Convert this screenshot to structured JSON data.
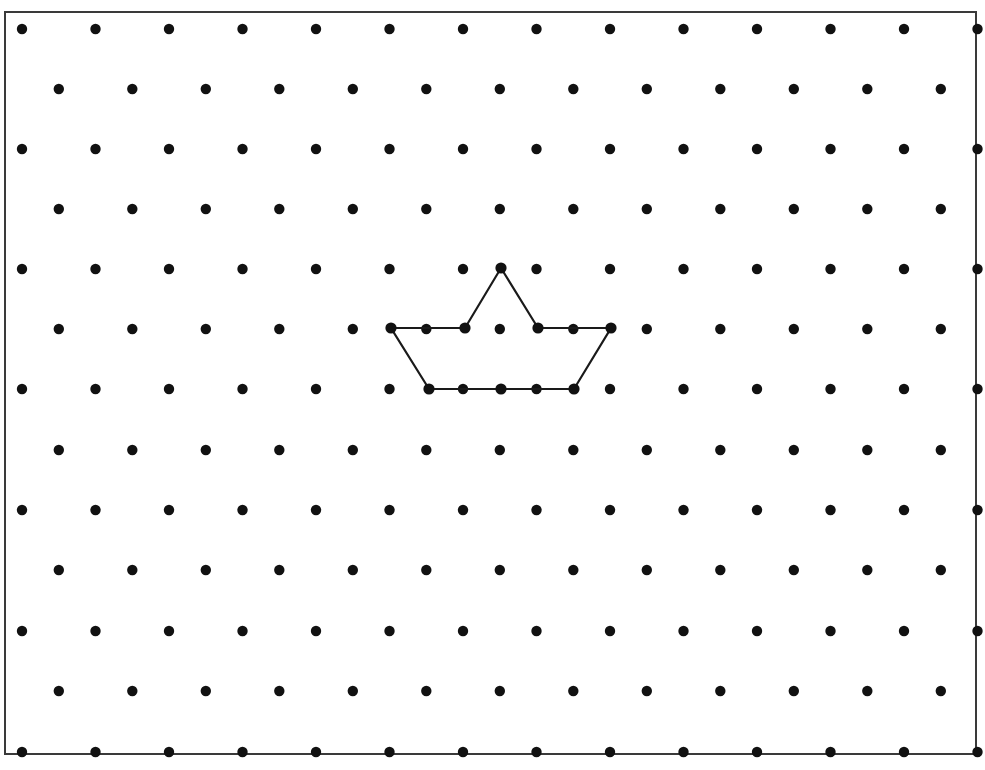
{
  "canvas": {
    "width": 985,
    "height": 770,
    "background_color": "#ffffff"
  },
  "frame": {
    "label": "board-frame",
    "x": 5,
    "y": 12,
    "width": 971,
    "height": 742,
    "stroke_color": "#3a3a3a",
    "stroke_width": 2,
    "fill": "none"
  },
  "grid": {
    "label": "staggered-peg-grid",
    "arrangement": "staggered",
    "dot_color": "#111111",
    "dot_radius": 5.2,
    "row_count": 13,
    "row_spacing": 60.3,
    "column_spacing": 73.5,
    "first_row_y": 29,
    "even_row_start_x": 22,
    "even_row_dot_count": 14,
    "odd_row_start_x": 58.8,
    "odd_row_dot_count": 13,
    "row_y_values": [
      29,
      89,
      149,
      209,
      269,
      329,
      389,
      450,
      510,
      570,
      631,
      691,
      752
    ],
    "even_row_x_values": [
      22,
      95.5,
      169,
      242.5,
      316,
      389.5,
      463,
      536.5,
      610,
      683.5,
      757,
      830.5,
      904,
      977.5
    ],
    "odd_row_x_values": [
      58.8,
      132.3,
      205.8,
      279.3,
      352.8,
      426.3,
      499.8,
      573.3,
      646.8,
      720.3,
      793.8,
      867.3,
      940.8
    ]
  },
  "shape": {
    "label": "boat-polygon",
    "name": "Boat / crown polygon",
    "closed": true,
    "stroke_color": "#1a1a1a",
    "stroke_width": 2.2,
    "fill": "none",
    "vertex_marker_color": "#111111",
    "vertex_marker_radius": 5.6,
    "vertices": [
      {
        "label": "left-gunwale",
        "x": 391,
        "y": 328
      },
      {
        "label": "left-mast-base",
        "x": 465,
        "y": 328
      },
      {
        "label": "mast-peak",
        "x": 501,
        "y": 268
      },
      {
        "label": "right-mast-base",
        "x": 538,
        "y": 328
      },
      {
        "label": "right-gunwale",
        "x": 611,
        "y": 328
      },
      {
        "label": "hull-bottom-right",
        "x": 574,
        "y": 389
      },
      {
        "label": "hull-bottom-left",
        "x": 429,
        "y": 389
      }
    ],
    "on_edge_points": [
      {
        "label": "hull-bottom-middle",
        "x": 501,
        "y": 389
      }
    ]
  }
}
